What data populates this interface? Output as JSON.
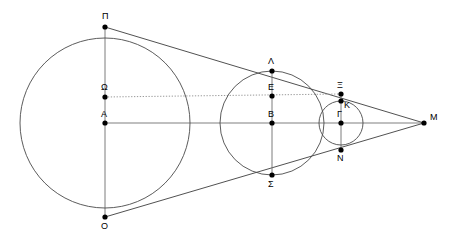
{
  "figure": {
    "width": 450,
    "height": 243,
    "background_color": "#ffffff",
    "stroke_color": "#3d3d3d",
    "axis_color": "#808080",
    "dotted_color": "#9a9a9a",
    "point_color": "#000000"
  },
  "points": [
    {
      "id": "P",
      "label": "Π",
      "x": 105,
      "y": 27,
      "lx": 102,
      "ly": 19,
      "role": "top-of-large-circle"
    },
    {
      "id": "Omega",
      "label": "Ω",
      "x": 105,
      "y": 97,
      "lx": 101,
      "ly": 90,
      "role": "dotted-line-left-end"
    },
    {
      "id": "A",
      "label": "A",
      "x": 105,
      "y": 123,
      "lx": 101,
      "ly": 117,
      "role": "center-large-circle"
    },
    {
      "id": "O",
      "label": "O",
      "x": 105,
      "y": 217,
      "lx": 101,
      "ly": 229,
      "role": "bottom-of-large-circle"
    },
    {
      "id": "L",
      "label": "Λ",
      "x": 272,
      "y": 71,
      "lx": 268,
      "ly": 64,
      "role": "top-of-middle-circle"
    },
    {
      "id": "E",
      "label": "E",
      "x": 272,
      "y": 96,
      "lx": 268,
      "ly": 90,
      "role": "middle-circle-upper"
    },
    {
      "id": "B",
      "label": "B",
      "x": 272,
      "y": 123,
      "lx": 268,
      "ly": 117,
      "role": "center-middle-circle"
    },
    {
      "id": "S",
      "label": "Σ",
      "x": 272,
      "y": 175,
      "lx": 268,
      "ly": 187,
      "role": "bottom-of-middle-circle"
    },
    {
      "id": "Xi",
      "label": "Ξ",
      "x": 341,
      "y": 94,
      "lx": 337,
      "ly": 88,
      "role": "dotted-line-right-end"
    },
    {
      "id": "K",
      "label": "K",
      "x": 341,
      "y": 101,
      "lx": 344,
      "ly": 108,
      "role": "tangent-crossing"
    },
    {
      "id": "G",
      "label": "Γ",
      "x": 341,
      "y": 123,
      "lx": 337,
      "ly": 117,
      "role": "center-small-circle"
    },
    {
      "id": "N",
      "label": "N",
      "x": 341,
      "y": 150,
      "lx": 337,
      "ly": 161,
      "role": "bottom-of-small-circle-region"
    },
    {
      "id": "M",
      "label": "M",
      "x": 424,
      "y": 123,
      "lx": 430,
      "ly": 120,
      "role": "apex-intersection"
    }
  ],
  "circles": [
    {
      "id": "large",
      "center": "A",
      "cx": 105,
      "cy": 123,
      "r": 85
    },
    {
      "id": "middle",
      "center": "B",
      "cx": 272,
      "cy": 123,
      "r": 52
    },
    {
      "id": "small",
      "center": "G",
      "cx": 341,
      "cy": 123,
      "r": 22
    }
  ],
  "segments": [
    {
      "id": "axis-A-M",
      "kind": "axis",
      "x1": 105,
      "y1": 123,
      "x2": 424,
      "y2": 123
    },
    {
      "id": "tangent-P-M",
      "kind": "line",
      "x1": 105,
      "y1": 27,
      "x2": 424,
      "y2": 123
    },
    {
      "id": "tangent-O-M",
      "kind": "line",
      "x1": 105,
      "y1": 217,
      "x2": 424,
      "y2": 123
    },
    {
      "id": "chord-Omega-Xi",
      "kind": "dotted",
      "x1": 105,
      "y1": 97,
      "x2": 341,
      "y2": 94
    },
    {
      "id": "diam-large",
      "kind": "vert",
      "x1": 105,
      "y1": 27,
      "x2": 105,
      "y2": 217
    },
    {
      "id": "diam-middle",
      "kind": "vert",
      "x1": 272,
      "y1": 71,
      "x2": 272,
      "y2": 175
    },
    {
      "id": "diam-small",
      "kind": "vert",
      "x1": 341,
      "y1": 94,
      "x2": 341,
      "y2": 150
    }
  ]
}
